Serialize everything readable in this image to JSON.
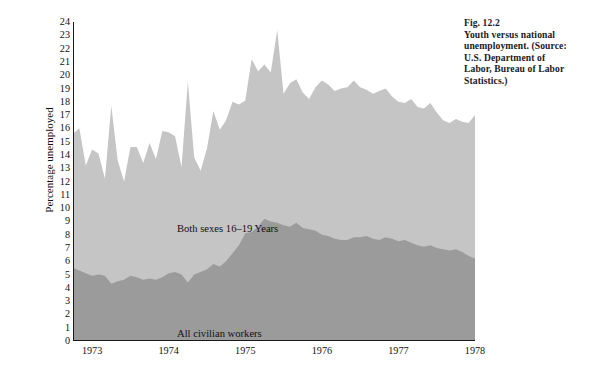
{
  "figure": {
    "caption_lines": [
      "Fig. 12.2",
      "Youth versus national",
      "unemployment. (Source:",
      "U.S. Department of",
      "Labor, Bureau of Labor",
      "Statistics.)"
    ]
  },
  "chart_data": {
    "type": "area",
    "title": "Youth versus national unemployment",
    "xlabel": "",
    "ylabel": "Percentage unemployed",
    "ylim": [
      0,
      24
    ],
    "ytick_labels": [
      "0",
      "1",
      "2",
      "3",
      "4",
      "5",
      "6",
      "7",
      "8",
      "9",
      "10",
      "11",
      "12",
      "13",
      "14",
      "15",
      "16",
      "17",
      "18",
      "19",
      "20",
      "21",
      "22",
      "23",
      "24"
    ],
    "xlim": [
      "1972.75",
      "1978.0"
    ],
    "xtick_labels": [
      "1973",
      "1974",
      "1975",
      "1976",
      "1977",
      "1978"
    ],
    "xtick_values": [
      1973,
      1974,
      1975,
      1976,
      1977,
      1978
    ],
    "minor_ticks": "monthly",
    "grid": false,
    "legend_position": "in-plot annotations",
    "colors": {
      "youth_series": "#c5c5c5",
      "civilian_series": "#9b9b9b",
      "axis": "#1a1a1a",
      "text": "#111111",
      "background": "#ffffff"
    },
    "annotations": [
      {
        "text": "Both sexes 16–19 Years",
        "x": 1973.2,
        "y": 10
      },
      {
        "text": "All civilian workers",
        "x": 1973.2,
        "y": 2
      }
    ],
    "x": [
      1972.75,
      1972.833,
      1972.917,
      1973.0,
      1973.083,
      1973.167,
      1973.25,
      1973.333,
      1973.417,
      1973.5,
      1973.583,
      1973.667,
      1973.75,
      1973.833,
      1973.917,
      1974.0,
      1974.083,
      1974.167,
      1974.25,
      1974.333,
      1974.417,
      1974.5,
      1974.583,
      1974.667,
      1974.75,
      1974.833,
      1974.917,
      1975.0,
      1975.083,
      1975.167,
      1975.25,
      1975.333,
      1975.417,
      1975.5,
      1975.583,
      1975.667,
      1975.75,
      1975.833,
      1975.917,
      1976.0,
      1976.083,
      1976.167,
      1976.25,
      1976.333,
      1976.417,
      1976.5,
      1976.583,
      1976.667,
      1976.75,
      1976.833,
      1976.917,
      1977.0,
      1977.083,
      1977.167,
      1977.25,
      1977.333,
      1977.417,
      1977.5,
      1977.583,
      1977.667,
      1977.75,
      1977.833,
      1977.917,
      1978.0
    ],
    "series": [
      {
        "name": "Both sexes 16–19 Years",
        "color": "#c5c5c5",
        "values": [
          15.6,
          16.0,
          13.2,
          14.4,
          14.1,
          12.2,
          17.7,
          13.6,
          12.0,
          14.6,
          14.6,
          13.4,
          14.9,
          13.7,
          15.8,
          15.7,
          15.4,
          13.1,
          19.5,
          13.8,
          12.8,
          14.5,
          17.3,
          15.9,
          16.6,
          18.0,
          17.8,
          18.1,
          21.2,
          20.3,
          20.8,
          20.2,
          23.4,
          18.6,
          19.4,
          19.7,
          18.7,
          18.2,
          19.1,
          19.6,
          19.3,
          18.8,
          19.0,
          19.1,
          19.6,
          19.1,
          18.9,
          18.6,
          18.8,
          19.0,
          18.4,
          18.0,
          17.9,
          18.2,
          17.6,
          17.5,
          17.9,
          17.2,
          16.6,
          16.4,
          16.7,
          16.5,
          16.4,
          17.0
        ]
      },
      {
        "name": "All civilian workers",
        "color": "#9b9b9b",
        "values": [
          5.5,
          5.3,
          5.1,
          4.9,
          5.0,
          4.9,
          4.3,
          4.5,
          4.6,
          4.9,
          4.8,
          4.6,
          4.7,
          4.6,
          4.8,
          5.1,
          5.2,
          5.0,
          4.4,
          5.0,
          5.2,
          5.4,
          5.8,
          5.6,
          6.0,
          6.6,
          7.2,
          8.1,
          8.2,
          8.6,
          9.2,
          9.0,
          8.9,
          8.7,
          8.6,
          8.9,
          8.5,
          8.4,
          8.3,
          8.0,
          7.9,
          7.7,
          7.6,
          7.6,
          7.8,
          7.8,
          7.9,
          7.7,
          7.6,
          7.8,
          7.7,
          7.5,
          7.6,
          7.4,
          7.2,
          7.1,
          7.2,
          7.0,
          6.9,
          6.8,
          6.9,
          6.7,
          6.4,
          6.2
        ]
      }
    ]
  }
}
